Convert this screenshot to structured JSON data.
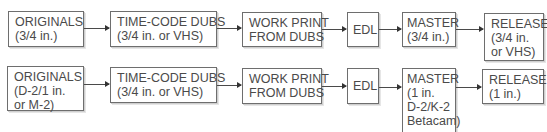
{
  "diagram": {
    "type": "flowchart",
    "rows": [
      {
        "name": "row-3-4-inch-workflow",
        "nodes": [
          {
            "id": "originals",
            "lines": [
              "ORIGINALS",
              "(3/4 in.)"
            ]
          },
          {
            "id": "time-code-dubs",
            "lines": [
              "TIME-CODE DUBS",
              "(3/4 in. or VHS)"
            ]
          },
          {
            "id": "work-print",
            "lines": [
              "WORK PRINT",
              "FROM DUBS"
            ]
          },
          {
            "id": "edl",
            "lines": [
              "EDL"
            ]
          },
          {
            "id": "master",
            "lines": [
              "MASTER",
              "(3/4 in.)"
            ]
          },
          {
            "id": "release",
            "lines": [
              "RELEASE",
              "(3/4 in.",
              "or VHS)"
            ]
          }
        ]
      },
      {
        "name": "row-1-inch-workflow",
        "nodes": [
          {
            "id": "originals",
            "lines": [
              "ORIGINALS",
              "(D-2/1 in.",
              "or M-2)"
            ]
          },
          {
            "id": "time-code-dubs",
            "lines": [
              "TIME-CODE DUBS",
              "(3/4 in. or VHS)"
            ]
          },
          {
            "id": "work-print",
            "lines": [
              "WORK PRINT",
              "FROM DUBS"
            ]
          },
          {
            "id": "edl",
            "lines": [
              "EDL"
            ]
          },
          {
            "id": "master",
            "lines": [
              "MASTER",
              "(1 in.",
              "D-2/K-2",
              "Betacam)"
            ]
          },
          {
            "id": "release",
            "lines": [
              "RELEASE",
              "(1 in.)"
            ]
          }
        ]
      }
    ],
    "edges": [
      [
        "originals",
        "time-code-dubs"
      ],
      [
        "time-code-dubs",
        "work-print"
      ],
      [
        "work-print",
        "edl"
      ],
      [
        "edl",
        "master"
      ],
      [
        "master",
        "release"
      ]
    ]
  }
}
